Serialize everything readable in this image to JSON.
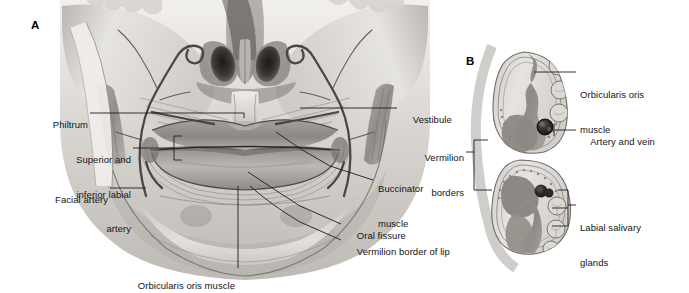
{
  "figure": {
    "panels": [
      {
        "id": "A",
        "letter": "A",
        "caption": "Anterior view of the perioral region"
      },
      {
        "id": "B",
        "letter": "B",
        "caption": "Sagittal cross-section of upper and lower lips"
      }
    ]
  },
  "panel_a": {
    "letter": "A",
    "labels": [
      {
        "name": "philtrum",
        "text": "Philtrum",
        "lines": [
          "Philtrum"
        ],
        "align": "right"
      },
      {
        "name": "superior-inferior-labial-artery",
        "text": "Superior and inferior labial artery",
        "lines": [
          "Superior and",
          "inferior labial",
          "artery"
        ],
        "align": "right"
      },
      {
        "name": "facial-artery",
        "text": "Facial artery",
        "lines": [
          "Facial artery"
        ],
        "align": "right"
      },
      {
        "name": "vestibule",
        "text": "Vestibule",
        "lines": [
          "Vestibule"
        ],
        "align": "left"
      },
      {
        "name": "buccinator-muscle",
        "text": "Buccinator muscle",
        "lines": [
          "Buccinator",
          "muscle"
        ],
        "align": "left"
      },
      {
        "name": "oral-fissure",
        "text": "Oral fissure",
        "lines": [
          "Oral fissure"
        ],
        "align": "left"
      },
      {
        "name": "vermilion-border-of-lip",
        "text": "Vermilion border of lip",
        "lines": [
          "Vermilion border of lip"
        ],
        "align": "left"
      },
      {
        "name": "orbicularis-oris-muscle",
        "text": "Orbicularis oris muscle",
        "lines": [
          "Orbicularis oris muscle"
        ],
        "align": "left"
      }
    ]
  },
  "panel_b": {
    "letter": "B",
    "labels": [
      {
        "name": "orbicularis-oris-muscle",
        "text": "Orbicularis oris muscle",
        "lines": [
          "Orbicularis oris",
          "muscle"
        ],
        "align": "left"
      },
      {
        "name": "artery-and-vein",
        "text": "Artery and vein",
        "lines": [
          "Artery and vein"
        ],
        "align": "left"
      },
      {
        "name": "vermilion-borders",
        "text": "Vermilion borders",
        "lines": [
          "Vermilion",
          "borders"
        ],
        "align": "right"
      },
      {
        "name": "labial-salivary-glands",
        "text": "Labial salivary glands",
        "lines": [
          "Labial salivary",
          "glands"
        ],
        "align": "left"
      }
    ]
  },
  "colors": {
    "background": "#ffffff",
    "label_text": "#141414",
    "leader_line": "#1d1d1d",
    "skin_light": "#e8e6e3",
    "skin_mid": "#c9c6c2",
    "skin_dark": "#9c9893",
    "shadow": "#6f6b67",
    "deep_shadow": "#3c3936",
    "vessel": "#4a4744",
    "muscle_mid": "#a7a39e",
    "muscle_dark": "#7e7a75",
    "gland_fill": "#d5d2ce",
    "outline": "#5a5754"
  }
}
